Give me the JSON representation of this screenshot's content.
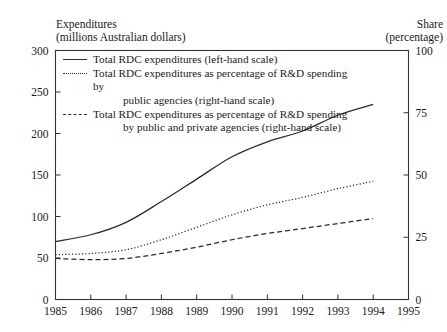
{
  "header": {
    "left_title": "Expenditures\n(millions Australian dollars)",
    "right_title": "Share\n(percentage)"
  },
  "legend": {
    "items": [
      {
        "key": "solid",
        "line1": "Total RDC expenditures (left-hand scale)",
        "line2": ""
      },
      {
        "key": "dotted",
        "line1": "Total RDC expenditures as percentage of R&D spending by",
        "line2": "public agencies (right-hand scale)"
      },
      {
        "key": "dashed",
        "line1": "Total RDC expenditures as percentage of  R&D spending",
        "line2": "by public and private agencies (right-hand scale)"
      }
    ]
  },
  "chart_data": {
    "type": "line",
    "title": "",
    "xlabel": "",
    "ylabel": "Expenditures (millions Australian dollars)",
    "y2label": "Share (percentage)",
    "x": [
      1985,
      1986,
      1987,
      1988,
      1989,
      1990,
      1991,
      1992,
      1993,
      1994,
      1995
    ],
    "xlim": [
      1985,
      1995
    ],
    "xticks": [
      "1985",
      "1986",
      "1987",
      "1988",
      "1989",
      "1990",
      "1991",
      "1992",
      "1993",
      "1994",
      "1995"
    ],
    "ylim": [
      0,
      300
    ],
    "yticks": [
      "0",
      "50",
      "100",
      "150",
      "200",
      "250",
      "300"
    ],
    "y2lim": [
      0,
      100
    ],
    "y2ticks": [
      "0",
      "25",
      "50",
      "75",
      "100"
    ],
    "grid": false,
    "legend_position": "upper-left-inside",
    "series": [
      {
        "name": "Total RDC expenditures (left-hand scale)",
        "style": "solid",
        "axis": "left",
        "x": [
          1985,
          1986,
          1987,
          1988,
          1989,
          1990,
          1991,
          1992,
          1993,
          1994
        ],
        "values": [
          70,
          78,
          93,
          118,
          145,
          172,
          190,
          203,
          222,
          235
        ]
      },
      {
        "name": "Total RDC expenditures as percentage of R&D spending by public agencies (right-hand scale)",
        "style": "dotted",
        "axis": "right",
        "x": [
          1985,
          1986,
          1987,
          1988,
          1989,
          1990,
          1991,
          1992,
          1993,
          1994
        ],
        "values": [
          18,
          18.5,
          20,
          24,
          29,
          34,
          38,
          41,
          44.5,
          47.5
        ]
      },
      {
        "name": "Total RDC expenditures as percentage of R&D spending by public and private agencies (right-hand scale)",
        "style": "dashed",
        "axis": "right",
        "x": [
          1985,
          1986,
          1987,
          1988,
          1989,
          1990,
          1991,
          1992,
          1993,
          1994
        ],
        "values": [
          16.5,
          16,
          16.5,
          18.5,
          21,
          24,
          26.5,
          28.5,
          30.5,
          32.5
        ]
      }
    ]
  }
}
